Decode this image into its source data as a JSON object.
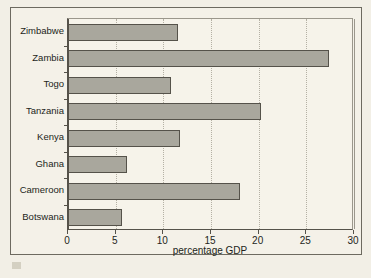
{
  "chart_data": {
    "type": "bar",
    "orientation": "horizontal",
    "title": "",
    "subtitle": "",
    "xlabel": "percentage GDP",
    "ylabel": "",
    "categories": [
      "Botswana",
      "Cameroon",
      "Ghana",
      "Kenya",
      "Tanzania",
      "Togo",
      "Zambia",
      "Zimbabwe"
    ],
    "values": [
      5.7,
      18.0,
      6.2,
      11.7,
      20.2,
      10.8,
      27.4,
      11.5
    ],
    "category_order_top_to_bottom": [
      "Zimbabwe",
      "Zambia",
      "Togo",
      "Tanzania",
      "Kenya",
      "Ghana",
      "Cameroon",
      "Botswana"
    ],
    "values_top_to_bottom": [
      11.5,
      27.4,
      10.8,
      20.2,
      11.7,
      6.2,
      18.0,
      5.7
    ],
    "xlim": [
      0,
      30
    ],
    "xticks": [
      0,
      5,
      10,
      15,
      20,
      25,
      30
    ],
    "xtick_labels": [
      "0",
      "5",
      "10",
      "15",
      "20",
      "25",
      "30"
    ],
    "grid": true,
    "grid_axis": "x",
    "grid_style": "dotted",
    "legend": false,
    "legend_position": "none",
    "bar_fill_color": "#a9a79d",
    "bar_edge_color": "#55524a",
    "plot_background_color": "#f6f3ea",
    "page_background_color": "#f2efe6",
    "axis_color": "#55524a",
    "text_color": "#231f1a"
  },
  "figure": {
    "outer_frame": true,
    "scan_artifact": true
  }
}
